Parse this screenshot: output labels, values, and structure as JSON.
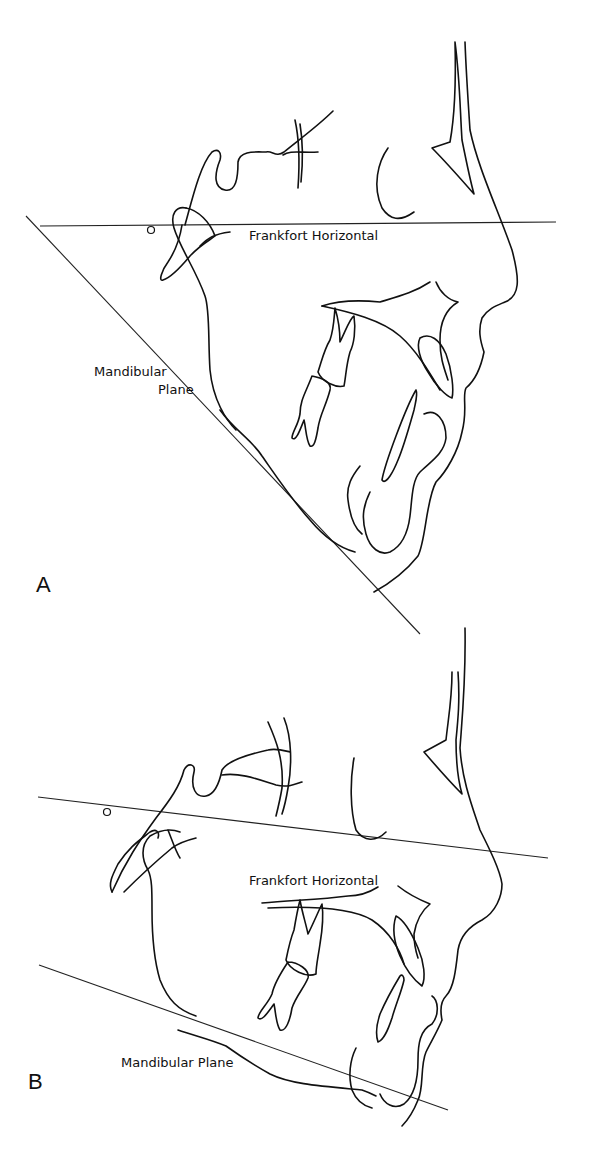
{
  "figure": {
    "panels": [
      {
        "id": "A",
        "label": "A",
        "annotations": {
          "frankfort": "Frankfort Horizontal",
          "mandibular_line1": "Mandibular",
          "mandibular_line2": "Plane"
        }
      },
      {
        "id": "B",
        "label": "B",
        "annotations": {
          "frankfort": "Frankfort Horizontal",
          "mandibular": "Mandibular Plane"
        }
      }
    ]
  }
}
